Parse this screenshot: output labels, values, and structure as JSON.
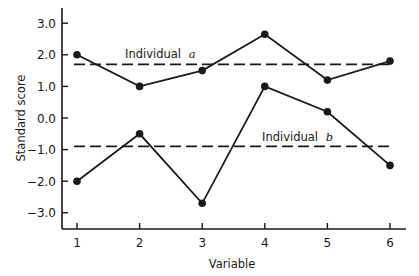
{
  "chart_data": {
    "type": "line",
    "title": "",
    "xlabel": "Variable",
    "ylabel": "Standard score",
    "x": [
      1,
      2,
      3,
      4,
      5,
      6
    ],
    "x_tick_labels": [
      "1",
      "2",
      "3",
      "4",
      "5",
      "6"
    ],
    "y_ticks": [
      3.0,
      2.0,
      1.0,
      0.0,
      -1.0,
      -2.0,
      -3.0
    ],
    "y_tick_labels": [
      "3.0",
      "2.0",
      "1.0",
      "0.0",
      "-1.0",
      "-2.0",
      "-3.0"
    ],
    "ylim": [
      -3.5,
      3.5
    ],
    "xlim": [
      0.8,
      6.25
    ],
    "grid": false,
    "legend": "inline labels above each mean line",
    "series": [
      {
        "name": "Individual a",
        "label_text": "Individual",
        "label_letter": "a",
        "values": [
          2.0,
          1.0,
          1.5,
          2.65,
          1.2,
          1.8
        ],
        "mean": 1.7,
        "mean_style": "dashed",
        "marker": "filled-circle",
        "color": "#1a1a1a"
      },
      {
        "name": "Individual b",
        "label_text": "Individual",
        "label_letter": "b",
        "values": [
          -2.0,
          -0.5,
          -2.7,
          1.0,
          0.2,
          -1.5
        ],
        "mean": -0.9,
        "mean_style": "dashed",
        "marker": "filled-circle",
        "color": "#1a1a1a"
      }
    ]
  },
  "layout": {
    "plot_left_px": 62,
    "plot_bottom_px": 229,
    "plot_top_px": 8,
    "x_axis_end_px": 406,
    "x_first_tick_px": 77,
    "x_tick_spacing_px": 62.6,
    "y_zero_px": 118,
    "y_px_per_unit": 31.6,
    "label_positions": [
      {
        "x": 125,
        "y": 58
      },
      {
        "x": 262,
        "y": 141
      }
    ]
  }
}
